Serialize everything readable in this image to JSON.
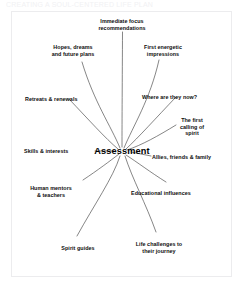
{
  "page": {
    "background_color": "#ffffff",
    "frame_color": "#ececee",
    "clipped_header_text": "CREATING A SOUL-CENTERED LIFE PLAN"
  },
  "diagram": {
    "type": "radial-mind-map",
    "hub_label": "Assessment",
    "line_color": "#3a3a3a",
    "text_color": "#0d0d0d",
    "branch_count": 12,
    "branches": [
      {
        "id": "immediate-focus",
        "label": "Immediate focus\nrecommendations",
        "position": "top"
      },
      {
        "id": "first-energetic",
        "label": "First energetic\nimpressions",
        "position": "top-right"
      },
      {
        "id": "hopes-dreams",
        "label": "Hopes, dreams\nand future plans",
        "position": "top-left"
      },
      {
        "id": "where-are-they-now",
        "label": "Where are they now?",
        "position": "upper-right"
      },
      {
        "id": "retreats-renewals",
        "label": "Retreats & renewals",
        "position": "upper-left"
      },
      {
        "id": "first-calling-spirit",
        "label": "The first\ncalling of\nspirit",
        "position": "right-upper"
      },
      {
        "id": "skills-interests",
        "label": "Skills & interests",
        "position": "left"
      },
      {
        "id": "allies-friends-family",
        "label": "Allies, friends & family",
        "position": "right"
      },
      {
        "id": "human-mentors",
        "label": "Human mentors\n& teachers",
        "position": "lower-left"
      },
      {
        "id": "educational-influences",
        "label": "Educational influences",
        "position": "lower-right"
      },
      {
        "id": "spirit-guides",
        "label": "Spirit guides",
        "position": "bottom-left"
      },
      {
        "id": "life-challenges",
        "label": "Life challenges to\ntheir journey",
        "position": "bottom-right"
      }
    ]
  }
}
